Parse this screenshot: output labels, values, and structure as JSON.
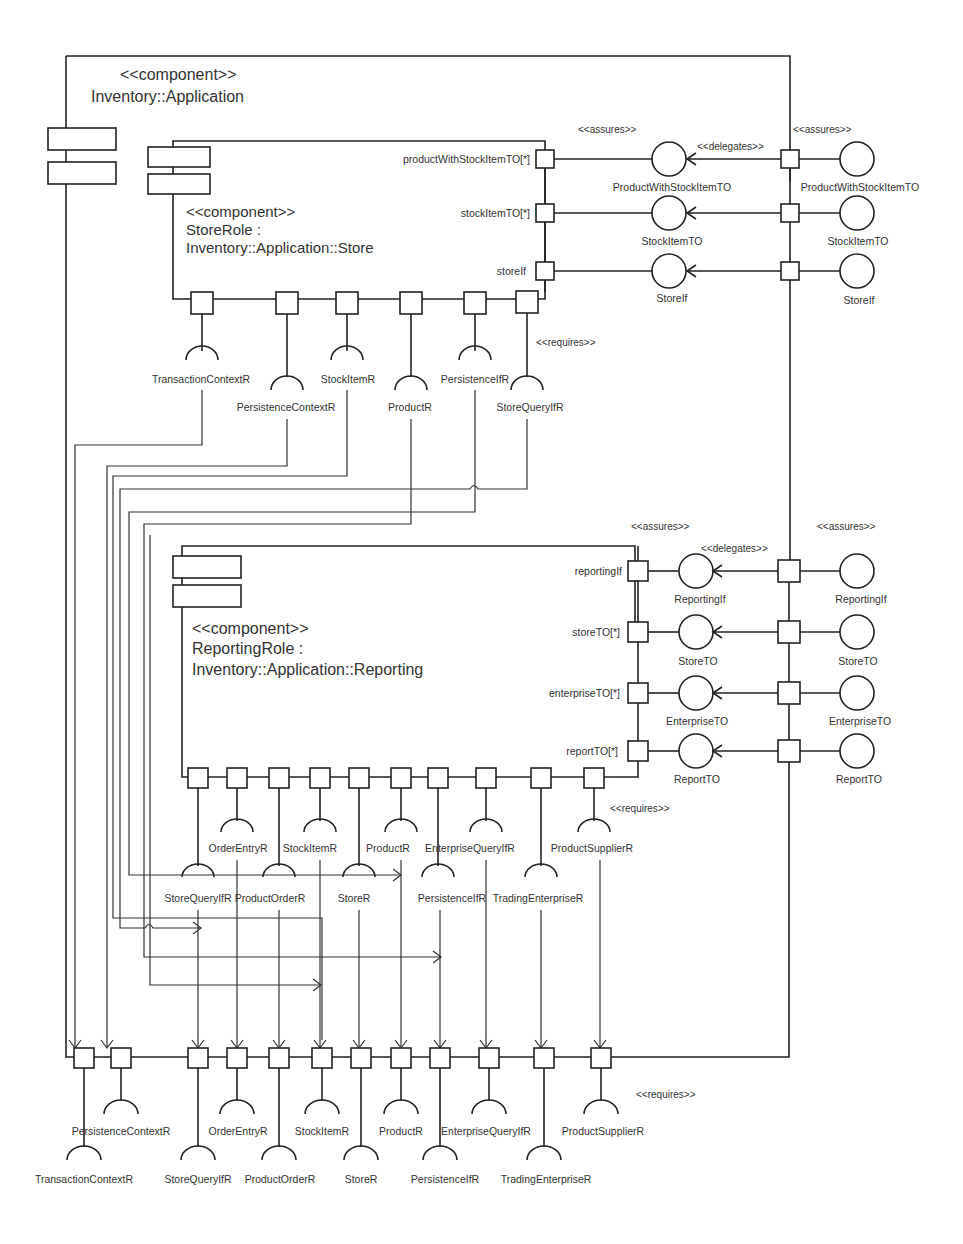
{
  "outer_component": {
    "stereotype": "<<component>>",
    "name": "Inventory::Application"
  },
  "store_component": {
    "stereotype": "<<component>>",
    "name_line1": "StoreRole :",
    "name_line2": "Inventory::Application::Store",
    "provided_ports": [
      {
        "port": "productWithStockItemTO[*]",
        "interface": "ProductWithStockItemTO",
        "outer_interface": "ProductWithStockItemTO"
      },
      {
        "port": "stockItemTO[*]",
        "interface": "StockItemTO",
        "outer_interface": "StockItemTO"
      },
      {
        "port": "storeIf",
        "interface": "StoreIf",
        "outer_interface": "StoreIf"
      }
    ],
    "required_interfaces": [
      "TransactionContextR",
      "PersistenceContextR",
      "StockItemR",
      "ProductR",
      "PersistenceIfR",
      "StoreQueryIfR"
    ],
    "labels": {
      "assures": "<<assures>>",
      "delegates": "<<delegates>>",
      "outer_assures": "<<assures>>",
      "requires": "<<requires>>"
    }
  },
  "reporting_component": {
    "stereotype": "<<component>>",
    "name_line1": "ReportingRole :",
    "name_line2": "Inventory::Application::Reporting",
    "provided_ports": [
      {
        "port": "reportingIf",
        "interface": "ReportingIf",
        "outer_interface": "ReportingIf"
      },
      {
        "port": "storeTO[*]",
        "interface": "StoreTO",
        "outer_interface": "StoreTO"
      },
      {
        "port": "enterpriseTO[*]",
        "interface": "EnterpriseTO",
        "outer_interface": "EnterpriseTO"
      },
      {
        "port": "reportTO[*]",
        "interface": "ReportTO",
        "outer_interface": "ReportTO"
      }
    ],
    "required_interfaces": [
      "StoreQueryIfR",
      "OrderEntryR",
      "ProductOrderR",
      "StockItemR",
      "StoreR",
      "ProductR",
      "PersistenceIfR",
      "EnterpriseQueryIfR",
      "TradingEnterpriseR",
      "ProductSupplierR"
    ],
    "labels": {
      "assures": "<<assures>>",
      "delegates": "<<delegates>>",
      "outer_assures": "<<assures>>",
      "requires": "<<requires>>"
    }
  },
  "outer_required_interfaces": {
    "items": [
      "TransactionContextR",
      "PersistenceContextR",
      "StoreQueryIfR",
      "OrderEntryR",
      "ProductOrderR",
      "StockItemR",
      "StoreR",
      "ProductR",
      "PersistenceIfR",
      "EnterpriseQueryIfR",
      "TradingEnterpriseR",
      "ProductSupplierR"
    ],
    "requires_label": "<<requires>>"
  }
}
